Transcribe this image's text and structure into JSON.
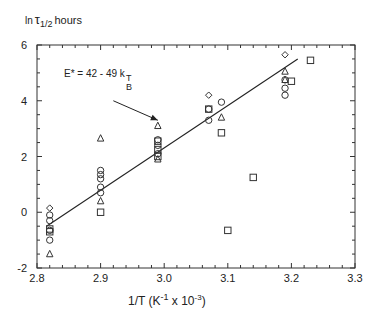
{
  "chart_data": {
    "type": "scatter",
    "title": "",
    "ylabel": "ln τ1/2 hours",
    "ylabel_parts": {
      "main": "ln",
      "symbol": "τ",
      "sub": "1/2",
      "unit": "hours"
    },
    "xlabel": "1/T (K-1 x 10-3)",
    "xlabel_parts": {
      "pre": "1/T (K",
      "sup1": "-1",
      "mid": " x 10",
      "sup2": "-3",
      "post": ")"
    },
    "xlim": [
      2.8,
      3.3
    ],
    "ylim": [
      -2,
      6
    ],
    "x_ticks": [
      "2.8",
      "2.9",
      "3.0",
      "3.1",
      "3.2",
      "3.3"
    ],
    "y_ticks": [
      "-2",
      "0",
      "2",
      "4",
      "6"
    ],
    "grid": false,
    "annotation": {
      "text": "E* = 42 - 49 k",
      "sub": "B",
      "sup": "T",
      "arrow_from": [
        2.92,
        4.0
      ],
      "arrow_to": [
        2.99,
        3.3
      ]
    },
    "fit_line": {
      "x": [
        2.815,
        3.21
      ],
      "y": [
        -0.5,
        5.5
      ]
    },
    "series": [
      {
        "name": "circles",
        "marker": "circle",
        "points": [
          [
            2.82,
            -0.1
          ],
          [
            2.82,
            -0.3
          ],
          [
            2.82,
            -1.0
          ],
          [
            2.82,
            -0.65
          ],
          [
            2.9,
            1.5
          ],
          [
            2.9,
            1.35
          ],
          [
            2.9,
            1.2
          ],
          [
            2.9,
            0.9
          ],
          [
            2.9,
            0.7
          ],
          [
            2.99,
            2.6
          ],
          [
            2.99,
            2.4
          ],
          [
            2.99,
            2.1
          ],
          [
            3.07,
            3.3
          ],
          [
            3.07,
            3.7
          ],
          [
            3.09,
            3.95
          ],
          [
            3.19,
            4.45
          ],
          [
            3.19,
            4.2
          ],
          [
            3.19,
            4.75
          ]
        ]
      },
      {
        "name": "diamonds",
        "marker": "diamond",
        "points": [
          [
            2.82,
            0.15
          ],
          [
            3.07,
            4.2
          ],
          [
            3.19,
            5.65
          ]
        ]
      },
      {
        "name": "triangles",
        "marker": "triangle",
        "points": [
          [
            2.82,
            -1.5
          ],
          [
            2.9,
            2.65
          ],
          [
            2.9,
            0.4
          ],
          [
            2.99,
            3.1
          ],
          [
            2.99,
            1.9
          ],
          [
            3.09,
            3.4
          ],
          [
            3.19,
            5.05
          ],
          [
            3.19,
            4.75
          ]
        ]
      },
      {
        "name": "squares",
        "marker": "square",
        "points": [
          [
            2.82,
            -0.6
          ],
          [
            2.82,
            -0.7
          ],
          [
            2.9,
            0.0
          ],
          [
            2.99,
            2.55
          ],
          [
            2.99,
            2.25
          ],
          [
            2.99,
            2.0
          ],
          [
            3.07,
            3.7
          ],
          [
            3.09,
            2.85
          ],
          [
            3.1,
            -0.65
          ],
          [
            3.14,
            1.25
          ],
          [
            3.2,
            4.7
          ],
          [
            3.23,
            5.45
          ]
        ]
      }
    ]
  }
}
